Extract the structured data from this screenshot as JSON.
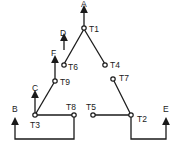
{
  "diagram": {
    "nodes": [
      {
        "id": "T1",
        "label": "T1"
      },
      {
        "id": "T2",
        "label": "T2"
      },
      {
        "id": "T3",
        "label": "T3"
      },
      {
        "id": "T4",
        "label": "T4"
      },
      {
        "id": "T5",
        "label": "T5"
      },
      {
        "id": "T6",
        "label": "T6"
      },
      {
        "id": "T7",
        "label": "T7"
      },
      {
        "id": "T8",
        "label": "T8"
      },
      {
        "id": "T9",
        "label": "T9"
      }
    ],
    "outputs": [
      {
        "id": "A",
        "label": "A"
      },
      {
        "id": "B",
        "label": "B"
      },
      {
        "id": "C",
        "label": "C"
      },
      {
        "id": "D",
        "label": "D"
      },
      {
        "id": "E",
        "label": "E"
      },
      {
        "id": "F",
        "label": "F"
      }
    ],
    "edges": [
      [
        "T1",
        "T6"
      ],
      [
        "T1",
        "T4"
      ],
      [
        "T6",
        "T9"
      ],
      [
        "T9",
        "T3"
      ],
      [
        "T3",
        "T8"
      ],
      [
        "T7",
        "T2"
      ],
      [
        "T5",
        "T2"
      ],
      [
        "T8",
        "B"
      ],
      [
        "T2",
        "E"
      ]
    ],
    "colors": {
      "line": "#1a1a1a",
      "background": "#ffffff"
    }
  }
}
